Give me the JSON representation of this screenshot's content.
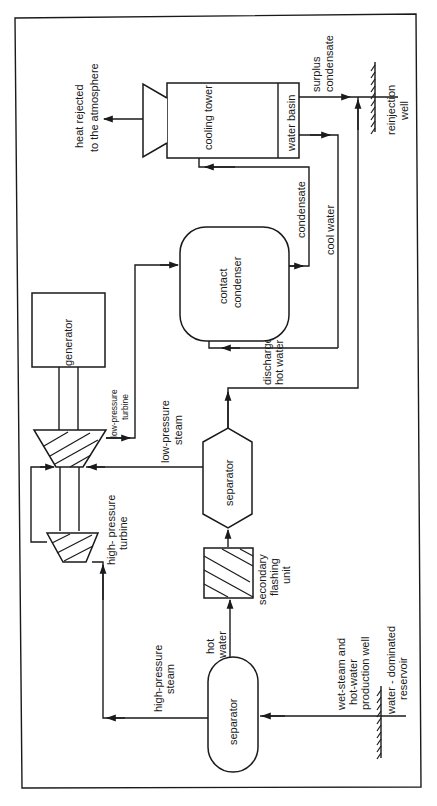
{
  "diagram": {
    "orientation": "rotated 90 degrees counter-clockwise",
    "components": {
      "cooling_tower": "cooling tower",
      "water_basin": "water basin",
      "contact_condenser": [
        "contact",
        "condenser"
      ],
      "generator": "generator",
      "low_pressure_turbine": [
        "low-pressure",
        "turbine"
      ],
      "high_pressure_turbine": [
        "high- pressure",
        "turbine"
      ],
      "separator_secondary": "separator",
      "secondary_flashing_unit": [
        "secondary",
        "flashing",
        "unit"
      ],
      "separator_primary": "separator",
      "reinjection_well": [
        "reinjection",
        "well"
      ],
      "production_well": [
        "wet-steam and",
        "hot-water",
        "production well"
      ],
      "reservoir": [
        "water - dominated",
        "reservoir"
      ]
    },
    "flows": {
      "heat_rejected": [
        "heat rejected",
        "to the atmosphere"
      ],
      "surplus_condensate": [
        "surplus",
        "condensate"
      ],
      "condensate": "condensate",
      "cool_water": "cool water",
      "discharge_hot_water": [
        "discharge",
        "hot water"
      ],
      "low_pressure_steam": [
        "low-pressure",
        "steam"
      ],
      "high_pressure_steam": [
        "high-pressure",
        "steam"
      ],
      "hot_water": [
        "hot",
        "water"
      ]
    }
  }
}
